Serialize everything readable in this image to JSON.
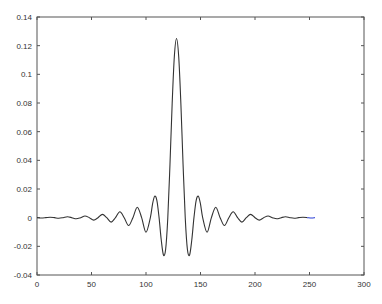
{
  "chart_data": {
    "type": "line",
    "title": "",
    "xlabel": "",
    "ylabel": "",
    "xlim": [
      0,
      300
    ],
    "ylim": [
      -0.04,
      0.14
    ],
    "grid": false,
    "legend": null,
    "x_ticks": [
      0,
      50,
      100,
      150,
      200,
      250,
      300
    ],
    "x_tick_labels": [
      "0",
      "50",
      "100",
      "150",
      "200",
      "250",
      "300"
    ],
    "y_ticks": [
      -0.04,
      -0.02,
      0,
      0.02,
      0.04,
      0.06,
      0.08,
      0.1,
      0.12,
      0.14
    ],
    "y_tick_labels": [
      "-0.04",
      "-0.02",
      "0",
      "0.02",
      "0.04",
      "0.06",
      "0.08",
      "0.1",
      "0.12",
      "0.14"
    ],
    "series": [
      {
        "name": "impulse response (windowed sinc)",
        "color": "#333333",
        "end_color": "#2b3fd6",
        "x": [
          0,
          4,
          8,
          12,
          16,
          20,
          24,
          28,
          32,
          36,
          40,
          44,
          48,
          52,
          56,
          60,
          64,
          68,
          72,
          76,
          80,
          84,
          88,
          92,
          96,
          100,
          104,
          106,
          108,
          110,
          112,
          114,
          116,
          118,
          120,
          122,
          124,
          126,
          128,
          130,
          132,
          134,
          136,
          138,
          140,
          142,
          144,
          146,
          148,
          150,
          152,
          156,
          160,
          164,
          168,
          172,
          176,
          180,
          184,
          188,
          192,
          196,
          200,
          204,
          208,
          212,
          216,
          220,
          224,
          228,
          232,
          236,
          240,
          244,
          248,
          252,
          255
        ],
        "values": [
          0,
          -0.0002,
          0,
          0.0003,
          0,
          -0.0004,
          0,
          0.0006,
          0,
          -0.0008,
          0,
          0.0012,
          0,
          -0.0017,
          0,
          0.0023,
          0,
          -0.0031,
          0,
          0.0041,
          0,
          -0.0055,
          0,
          0.0073,
          0,
          -0.0102,
          0,
          0.0095,
          0.015,
          0.0119,
          0,
          -0.0156,
          -0.026,
          -0.0222,
          0,
          0.0373,
          0.0795,
          0.1124,
          0.125,
          0.1124,
          0.0795,
          0.0373,
          0,
          -0.0222,
          -0.026,
          -0.0156,
          0,
          0.0119,
          0.015,
          0.0095,
          0,
          -0.0102,
          0,
          0.0073,
          0,
          -0.0055,
          0,
          0.0041,
          0,
          -0.0031,
          0,
          0.0023,
          0,
          -0.0017,
          0,
          0.0012,
          0,
          -0.0008,
          0,
          0.0006,
          0,
          -0.0004,
          0,
          0.0003,
          0,
          -0.0002,
          0
        ]
      }
    ]
  }
}
